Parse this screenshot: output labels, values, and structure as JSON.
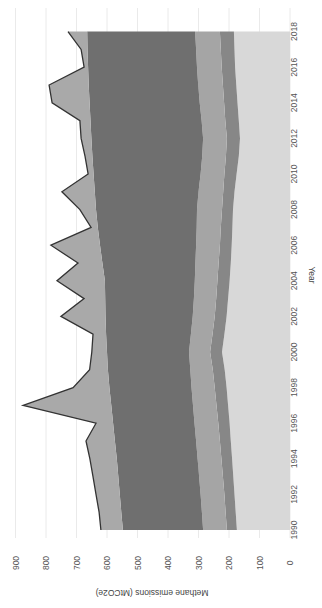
{
  "chart_data": {
    "type": "area",
    "stacked": true,
    "orientation": "rotated-90-clockwise",
    "title": "",
    "xlabel": "Year",
    "ylabel": "Methane emissions (MtCO2e)",
    "ylim": [
      0,
      900
    ],
    "y_ticks": [
      "0",
      "100",
      "200",
      "300",
      "400",
      "500",
      "600",
      "700",
      "800",
      "900"
    ],
    "x_ticks": [
      "1990",
      "1992",
      "1994",
      "1996",
      "1998",
      "2000",
      "2002",
      "2004",
      "2006",
      "2008",
      "2010",
      "2012",
      "2014",
      "2016",
      "2018"
    ],
    "grid": true,
    "legend": "none",
    "x": [
      1990,
      1991,
      1992,
      1993,
      1994,
      1995,
      1996,
      1997,
      1998,
      1999,
      2000,
      2001,
      2002,
      2003,
      2004,
      2005,
      2006,
      2007,
      2008,
      2009,
      2010,
      2011,
      2012,
      2013,
      2014,
      2015,
      2016,
      2017,
      2018
    ],
    "boundaries": {
      "A": [
        174,
        178,
        182,
        186,
        190,
        194,
        198,
        203,
        208,
        214,
        223,
        215,
        208,
        203,
        198,
        194,
        191,
        189,
        187,
        182,
        175,
        168,
        164,
        168,
        172,
        176,
        180,
        182,
        184
      ],
      "B": [
        207,
        211,
        215,
        220,
        225,
        230,
        235,
        241,
        247,
        253,
        262,
        254,
        247,
        242,
        238,
        234,
        230,
        227,
        223,
        219,
        215,
        210,
        207,
        212,
        216,
        220,
        224,
        227,
        230
      ],
      "C": [
        285,
        289,
        293,
        298,
        303,
        308,
        313,
        318,
        323,
        327,
        331,
        325,
        319,
        315,
        312,
        310,
        308,
        306,
        305,
        300,
        293,
        288,
        285,
        290,
        296,
        301,
        305,
        308,
        311
      ],
      "D": [
        548,
        553,
        558,
        563,
        568,
        574,
        580,
        586,
        592,
        597,
        600,
        603,
        605,
        606,
        607,
        615,
        623,
        630,
        636,
        640,
        644,
        648,
        651,
        654,
        657,
        660,
        662,
        664,
        665
      ]
    },
    "series": [
      {
        "name": "Layer 1 (lightest)",
        "color": "#d8d8d8",
        "values": [
          174,
          178,
          182,
          186,
          190,
          194,
          198,
          203,
          208,
          214,
          223,
          215,
          208,
          203,
          198,
          194,
          191,
          189,
          187,
          182,
          175,
          168,
          164,
          168,
          172,
          176,
          180,
          182,
          184
        ]
      },
      {
        "name": "Layer 2",
        "color": "#878787",
        "values": [
          33,
          33,
          33,
          34,
          35,
          36,
          37,
          38,
          39,
          39,
          39,
          39,
          39,
          39,
          40,
          40,
          39,
          38,
          36,
          37,
          40,
          42,
          43,
          44,
          44,
          44,
          44,
          45,
          46
        ]
      },
      {
        "name": "Layer 3",
        "color": "#a5a5a5",
        "values": [
          78,
          78,
          78,
          78,
          78,
          78,
          78,
          77,
          76,
          74,
          69,
          71,
          72,
          73,
          74,
          76,
          78,
          79,
          82,
          81,
          78,
          78,
          78,
          78,
          80,
          81,
          81,
          81,
          81
        ]
      },
      {
        "name": "Layer 4 (dark)",
        "color": "#6f6f6f",
        "values": [
          263,
          264,
          265,
          265,
          265,
          266,
          267,
          268,
          269,
          270,
          269,
          278,
          286,
          291,
          295,
          305,
          315,
          324,
          331,
          340,
          351,
          360,
          366,
          364,
          361,
          359,
          357,
          356,
          354
        ]
      },
      {
        "name": "Layer 5 (outer)",
        "color": "#a9a9a9",
        "values": [
          72,
          73,
          78,
          83,
          88,
          95,
          56,
          289,
          119,
          60,
          50,
          43,
          146,
          69,
          157,
          80,
          161,
          22,
          53,
          108,
          18,
          24,
          34,
          35,
          123,
          130,
          13,
          21,
          63
        ]
      }
    ],
    "total": [
      620,
      626,
      636,
      646,
      656,
      669,
      636,
      875,
      711,
      657,
      650,
      646,
      751,
      675,
      764,
      695,
      784,
      652,
      689,
      748,
      662,
      672,
      685,
      689,
      780,
      790,
      675,
      685,
      728
    ],
    "total_line_color": "#333333"
  }
}
